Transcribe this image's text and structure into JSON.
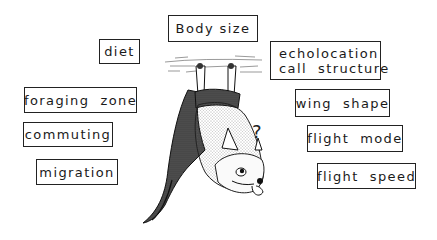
{
  "figure": {
    "center_illustration": "bat-hanging-upside-down-with-question-mark",
    "question_mark": "?",
    "labels": [
      {
        "id": "body-size",
        "text": "Body size"
      },
      {
        "id": "diet",
        "text": "diet"
      },
      {
        "id": "foraging-zone",
        "text": "foraging  zone"
      },
      {
        "id": "commuting",
        "text": "commuting"
      },
      {
        "id": "migration",
        "text": "migration"
      },
      {
        "id": "echolocation",
        "lines": [
          "echolocation",
          "call  structure"
        ]
      },
      {
        "id": "wing-shape",
        "text": "wing  shape"
      },
      {
        "id": "flight-mode",
        "text": "flight  mode"
      },
      {
        "id": "flight-speed",
        "text": "flight  speed"
      }
    ]
  }
}
